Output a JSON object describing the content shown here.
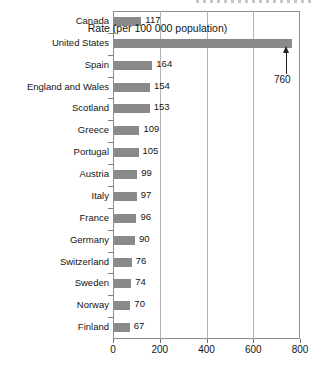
{
  "chart_data": {
    "type": "bar",
    "orientation": "horizontal",
    "title": "",
    "xlabel": "Rate (per 100 000 population)",
    "ylabel": "",
    "xlim": [
      0,
      800
    ],
    "xticks": [
      0,
      200,
      400,
      600,
      800
    ],
    "gridlines": [
      200,
      400,
      600
    ],
    "grid": true,
    "legend": null,
    "bar_color": "#8a8a8a",
    "categories": [
      "Canada",
      "United States",
      "Spain",
      "England and Wales",
      "Scotland",
      "Greece",
      "Portugal",
      "Austria",
      "Italy",
      "France",
      "Germany",
      "Switzerland",
      "Sweden",
      "Norway",
      "Finland"
    ],
    "values": [
      117,
      760,
      164,
      154,
      153,
      109,
      105,
      99,
      97,
      96,
      90,
      76,
      74,
      70,
      67
    ],
    "value_labels": [
      "117",
      "",
      "164",
      "154",
      "153",
      "109",
      "105",
      "99",
      "97",
      "96",
      "90",
      "76",
      "74",
      "70",
      "67"
    ],
    "annotations": [
      {
        "name": "united-states-value-callout",
        "text": "760",
        "category": "United States",
        "value": 760,
        "marker": "up-arrow"
      }
    ]
  },
  "axis": {
    "x_tick_labels": [
      "0",
      "200",
      "400",
      "600",
      "800"
    ],
    "x_title": "Rate (per 100 000 population)"
  }
}
